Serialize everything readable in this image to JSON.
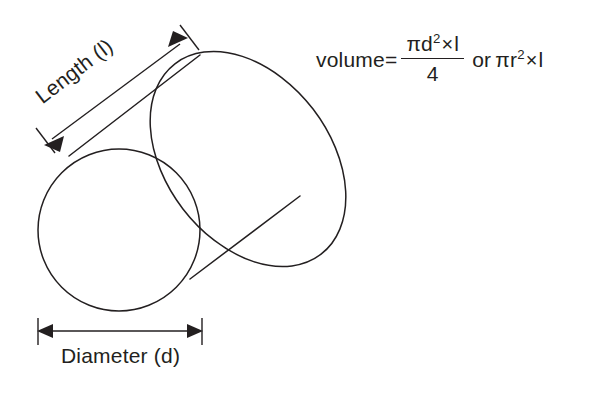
{
  "figure": {
    "shape": "cylinder",
    "background_color": "#ffffff",
    "line_color": "#231f20",
    "text_color": "#231f20"
  },
  "labels": {
    "length": "Length (l)",
    "diameter": "Diameter (d)"
  },
  "formula": {
    "lead": "volume=",
    "numerator_pi_d": "πd",
    "numerator_exponent": "2",
    "numerator_times": "×",
    "numerator_l": "l",
    "denominator": "4",
    "connector": "or",
    "alt_pi_r": "πr",
    "alt_exponent": "2",
    "alt_times": "×",
    "alt_l": "l",
    "full_text": "volume= πd²×l / 4 or πr²×l"
  },
  "annotations": {
    "length_arrow": "double-headed dimension arrow along cylinder axis",
    "diameter_arrow": "double-headed dimension arrow under front circular face"
  }
}
